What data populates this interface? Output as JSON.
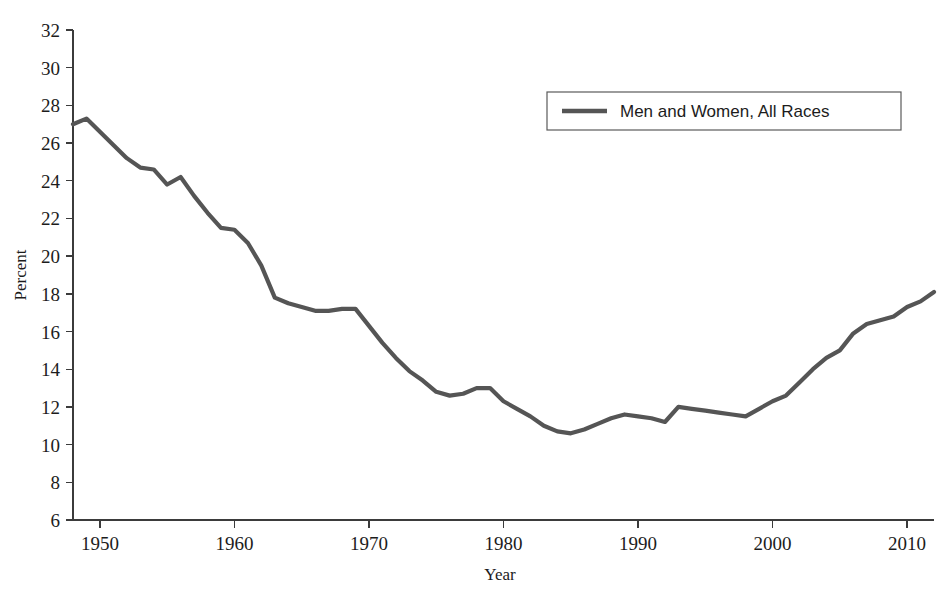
{
  "chart_data": {
    "type": "line",
    "title": "",
    "subtitle": "",
    "xlabel": "Year",
    "ylabel": "Percent",
    "xlim": [
      1948,
      2012
    ],
    "ylim": [
      6,
      32
    ],
    "grid": false,
    "legend_position": "top-right",
    "x_ticks": [
      1950,
      1960,
      1970,
      1980,
      1990,
      2000,
      2010
    ],
    "x_tick_labels": [
      "1950",
      "1960",
      "1970",
      "1980",
      "1990",
      "2000",
      "2010"
    ],
    "y_ticks": [
      6,
      8,
      10,
      12,
      14,
      16,
      18,
      20,
      22,
      24,
      26,
      28,
      30,
      32
    ],
    "y_tick_labels": [
      "6",
      "8",
      "10",
      "12",
      "14",
      "16",
      "18",
      "20",
      "22",
      "24",
      "26",
      "28",
      "30",
      "32"
    ],
    "series": [
      {
        "name": "Men and Women, All Races",
        "color": "#555555",
        "line_width": 4.2,
        "x": [
          1948,
          1949,
          1950,
          1951,
          1952,
          1953,
          1954,
          1955,
          1956,
          1957,
          1958,
          1959,
          1960,
          1961,
          1962,
          1963,
          1964,
          1965,
          1966,
          1967,
          1968,
          1969,
          1970,
          1971,
          1972,
          1973,
          1974,
          1975,
          1976,
          1977,
          1978,
          1979,
          1980,
          1981,
          1982,
          1983,
          1984,
          1985,
          1986,
          1987,
          1988,
          1989,
          1990,
          1991,
          1992,
          1993,
          1994,
          1995,
          1996,
          1997,
          1998,
          1999,
          2000,
          2001,
          2002,
          2003,
          2004,
          2005,
          2006,
          2007,
          2008,
          2009,
          2010,
          2011,
          2012
        ],
        "values": [
          27.0,
          27.3,
          26.6,
          25.9,
          25.2,
          24.7,
          24.6,
          23.8,
          24.2,
          23.2,
          22.3,
          21.5,
          21.4,
          20.7,
          19.5,
          17.8,
          17.5,
          17.3,
          17.1,
          17.1,
          17.2,
          17.2,
          16.3,
          15.4,
          14.6,
          13.9,
          13.4,
          12.8,
          12.6,
          12.7,
          13.0,
          13.0,
          12.3,
          11.9,
          11.5,
          11.0,
          10.7,
          10.6,
          10.8,
          11.1,
          11.4,
          11.6,
          11.5,
          11.4,
          11.2,
          12.0,
          11.9,
          11.8,
          11.7,
          11.6,
          11.5,
          11.9,
          12.3,
          12.6,
          13.3,
          14.0,
          14.6,
          15.0,
          15.9,
          16.4,
          16.6,
          16.8,
          17.3,
          17.6,
          18.1
        ],
        "first_value": 27.0,
        "last_value": 18.1,
        "min_value": 10.6,
        "min_year": 1985,
        "max_value": 27.3,
        "max_year": 1949
      }
    ],
    "legend": [
      {
        "label": "Men and Women, All Races",
        "color": "#555555"
      }
    ]
  },
  "axes": {
    "y_title": "Percent",
    "x_title": "Year"
  },
  "legend_panel": {
    "entry_label": "Men and Women, All Races"
  },
  "colors": {
    "line": "#555555",
    "axis": "#3b3b3b",
    "text": "#1c1c1c",
    "background": "#ffffff",
    "legend_border": "#5a5a5a"
  }
}
